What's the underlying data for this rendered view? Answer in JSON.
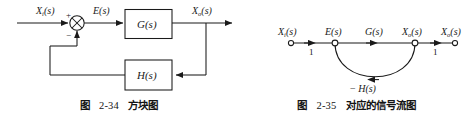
{
  "page": {
    "background_color": "#ffffff",
    "ink_color": "#1a1a1a",
    "width": 475,
    "height": 121
  },
  "block_diagram": {
    "caption": {
      "label": "图",
      "number": "2-34",
      "title": "方块图"
    },
    "signals": {
      "input": "X",
      "input_sub": "i",
      "input_arg": "(s)",
      "error": "E",
      "error_arg": "(s)",
      "output": "X",
      "output_sub": "o",
      "output_arg": "(s)"
    },
    "summing_junction": {
      "name": "summing-junction",
      "plus_sign": "+",
      "minus_sign": "−"
    },
    "blocks": [
      {
        "id": "forward",
        "name": "G",
        "arg": "(s)",
        "label": "G(s)"
      },
      {
        "id": "feedback",
        "name": "H",
        "arg": "(s)",
        "label": "H(s)"
      }
    ]
  },
  "signal_flow_graph": {
    "caption": {
      "label": "图",
      "number": "2-35",
      "title": "对应的信号流图"
    },
    "nodes": [
      {
        "id": "xi",
        "sym": "X",
        "sub": "i",
        "arg": "(s)",
        "label": "Xi(s)"
      },
      {
        "id": "e",
        "sym": "E",
        "sub": "",
        "arg": "(s)",
        "label": "E(s)"
      },
      {
        "id": "xo1",
        "sym": "X",
        "sub": "o",
        "arg": "(s)",
        "label": "Xo(s)"
      },
      {
        "id": "xo2",
        "sym": "X",
        "sub": "o",
        "arg": "(s)",
        "label": "Xo(s)"
      }
    ],
    "branch_top_label": {
      "sym": "G",
      "arg": "(s)",
      "label": "G(s)"
    },
    "branch_gains": [
      {
        "id": "gain-input",
        "value": "1"
      },
      {
        "id": "gain-output",
        "value": "1"
      }
    ],
    "feedback_branch": {
      "minus": "−",
      "sym": "H",
      "arg": "(s)",
      "label": "− H(s)"
    }
  }
}
